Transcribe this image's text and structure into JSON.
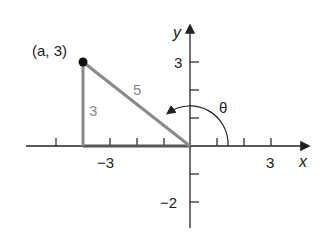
{
  "figure": {
    "point_label": "(a, 3)",
    "opposite_side_label": "3",
    "hypotenuse_label": "5",
    "angle_label": "θ",
    "x_axis_label": "x",
    "y_axis_label": "y",
    "x_ticks": [
      {
        "value": -3,
        "label": "−3"
      },
      {
        "value": 3,
        "label": "3"
      }
    ],
    "y_ticks": [
      {
        "value": 3,
        "label": "3"
      },
      {
        "value": -2,
        "label": "−2"
      }
    ],
    "colors": {
      "axis": "#222222",
      "triangle": "#8a8a8a",
      "point": "#111111"
    }
  }
}
